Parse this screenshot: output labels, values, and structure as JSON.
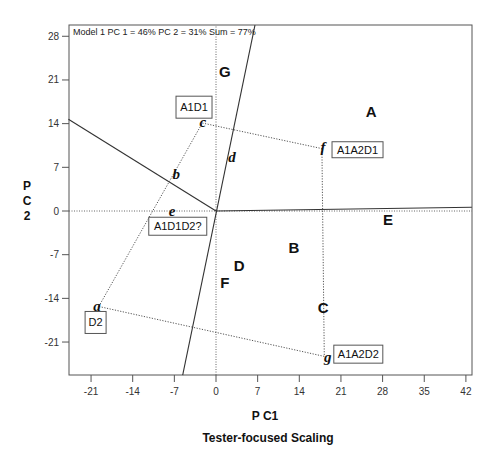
{
  "chart_data": {
    "type": "scatter",
    "title": "Tester-focused Scaling",
    "subtitle": "Model 1 PC 1 = 46% PC 2 = 31% Sum = 77%",
    "xlabel": "P C1",
    "ylabel": "P C 2",
    "ylabel_chars": [
      "P",
      "C",
      "2"
    ],
    "xlim": [
      -25.0,
      43.0
    ],
    "ylim": [
      -26.5,
      29.8
    ],
    "xticks": [
      -21,
      -14,
      -7,
      0,
      7,
      14,
      21,
      28,
      35,
      42
    ],
    "yticks": [
      -21,
      -14,
      -7,
      0,
      7,
      14,
      21,
      28
    ],
    "grid": false,
    "reference_lines": [
      {
        "style": "dotted",
        "from": [
          0,
          -26.5
        ],
        "to": [
          0,
          29.8
        ]
      },
      {
        "style": "dotted",
        "from": [
          -25.0,
          0
        ],
        "to": [
          43.0,
          0
        ]
      }
    ],
    "vector_lines": [
      {
        "style": "solid",
        "from": [
          -5.6,
          -26.3
        ],
        "to": [
          6.55,
          29.8
        ]
      },
      {
        "style": "solid",
        "from": [
          -24.8,
          14.7
        ],
        "to": [
          0,
          0
        ]
      },
      {
        "style": "solid",
        "from": [
          0,
          0
        ],
        "to": [
          43.0,
          0.6
        ]
      }
    ],
    "polygon": {
      "style": "dotted",
      "path": [
        "a",
        "c",
        "f",
        "g",
        "a"
      ]
    },
    "points": [
      {
        "label": "A",
        "x": 26.1,
        "y": 15.9
      },
      {
        "label": "B",
        "x": 13.1,
        "y": -5.9
      },
      {
        "label": "C",
        "x": 18.0,
        "y": -15.5
      },
      {
        "label": "D",
        "x": 3.9,
        "y": -8.8
      },
      {
        "label": "E",
        "x": 28.9,
        "y": -1.4
      },
      {
        "label": "F",
        "x": 1.5,
        "y": -11.4
      },
      {
        "label": "G",
        "x": 1.5,
        "y": 22.3
      }
    ],
    "vertices": [
      {
        "label": "a",
        "x": -20.0,
        "y": -15.4
      },
      {
        "label": "b",
        "x": -6.7,
        "y": 5.8
      },
      {
        "label": "c",
        "x": -2.2,
        "y": 14.1
      },
      {
        "label": "d",
        "x": 2.7,
        "y": 8.5
      },
      {
        "label": "e",
        "x": -7.4,
        "y": -0.2
      },
      {
        "label": "f",
        "x": 18.0,
        "y": 10.1
      },
      {
        "label": "g",
        "x": 18.8,
        "y": -23.6
      }
    ],
    "polygon_coords": {
      "a": [
        -19.7,
        -15.3
      ],
      "c": [
        -2.3,
        14.1
      ],
      "f": [
        17.8,
        10.0
      ],
      "g": [
        18.2,
        -23.3
      ]
    },
    "boxed_labels": [
      {
        "text": "A1D1",
        "vertex": "c",
        "x": -6.72,
        "y": 18.4,
        "w": 36,
        "h": 22
      },
      {
        "text": "A1A2D1",
        "vertex": "f",
        "x": 19.5,
        "y": 11.1,
        "w": 51,
        "h": 16
      },
      {
        "text": "A1A2D2",
        "vertex": "g",
        "x": 19.8,
        "y": -21.5,
        "w": 49,
        "h": 18
      },
      {
        "text": "D2",
        "vertex": "a",
        "x": -22.0,
        "y": -16.1,
        "w": 21,
        "h": 22
      },
      {
        "text": "A1D1D2?",
        "vertex": "e",
        "x": -11.3,
        "y": -1.0,
        "w": 58,
        "h": 18
      }
    ],
    "frame": {
      "left": 69,
      "top": 25,
      "right": 472,
      "bottom": 375
    },
    "origin_px": [
      216,
      211
    ],
    "px_per_unit": [
      5.95,
      6.24
    ],
    "colors": {
      "line": "#333333",
      "frame": "#555555",
      "text": "#111111"
    }
  }
}
